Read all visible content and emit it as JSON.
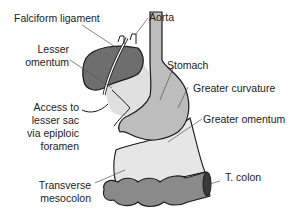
{
  "diagram": {
    "labels": {
      "falciform": "Falciform ligament",
      "aorta": "Aorta",
      "lesser_omentum_1": "Lesser",
      "lesser_omentum_2": "omentum",
      "stomach": "Stomach",
      "greater_curvature": "Greater curvature",
      "access_1": "Access to",
      "access_2": "lesser sac",
      "access_3": "via epiploic",
      "access_4": "foramen",
      "greater_omentum": "Greater omentum",
      "t_colon": "T. colon",
      "transverse_1": "Transverse",
      "transverse_2": "mesocolon"
    },
    "colors": {
      "liver": "#6e6e6e",
      "stomach": "#bdbdbd",
      "omentum": "#e6e6e6",
      "colon": "#8a8a8a",
      "outline": "#1a1a1a",
      "leader": "#555555"
    }
  }
}
